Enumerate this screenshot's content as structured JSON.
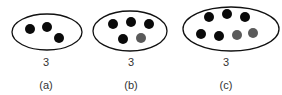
{
  "colors": {
    "outline": "#111111",
    "black_dot": "#0a0a0a",
    "gray_dot": "#5a5a5a",
    "text": "#333333"
  },
  "panels": [
    {
      "label": "(a)",
      "count": "3",
      "ellipse": {
        "cx": 47,
        "cy": 32,
        "rx": 35,
        "ry": 18
      },
      "dots": [
        {
          "x": 30,
          "y": 29,
          "color": "black"
        },
        {
          "x": 47,
          "y": 27,
          "color": "black"
        },
        {
          "x": 59,
          "y": 38,
          "color": "black"
        }
      ],
      "text_x": 46
    },
    {
      "label": "(b)",
      "count": "3",
      "ellipse": {
        "cx": 130,
        "cy": 31,
        "rx": 37,
        "ry": 20
      },
      "dots": [
        {
          "x": 113,
          "y": 24,
          "color": "black"
        },
        {
          "x": 131,
          "y": 22,
          "color": "black"
        },
        {
          "x": 149,
          "y": 24,
          "color": "black"
        },
        {
          "x": 123,
          "y": 39,
          "color": "black"
        },
        {
          "x": 141,
          "y": 38,
          "color": "gray"
        }
      ],
      "text_x": 131
    },
    {
      "label": "(c)",
      "count": "3",
      "ellipse": {
        "cx": 231,
        "cy": 29,
        "rx": 48,
        "ry": 22
      },
      "dots": [
        {
          "x": 209,
          "y": 17,
          "color": "black"
        },
        {
          "x": 227,
          "y": 14,
          "color": "black"
        },
        {
          "x": 245,
          "y": 17,
          "color": "black"
        },
        {
          "x": 201,
          "y": 34,
          "color": "black"
        },
        {
          "x": 219,
          "y": 36,
          "color": "black"
        },
        {
          "x": 237,
          "y": 35,
          "color": "gray"
        },
        {
          "x": 253,
          "y": 33,
          "color": "gray"
        }
      ],
      "text_x": 226
    }
  ]
}
